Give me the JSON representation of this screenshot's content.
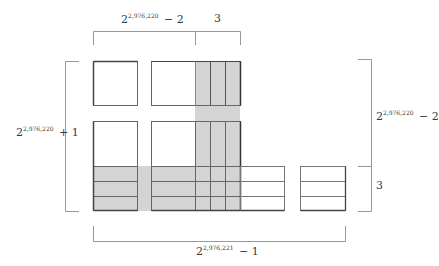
{
  "diagram": {
    "colors": {
      "shade": "#d3d3d3",
      "line": "#555555",
      "bracket": "#999999",
      "box_light": "#aaaaaa"
    },
    "labels": {
      "top_left": {
        "base": "2",
        "exp": "2,976,220",
        "tail": " − 2"
      },
      "top_right": {
        "text": "3"
      },
      "left": {
        "base": "2",
        "exp": "2,976,220",
        "tail": " + 1"
      },
      "right_upper": {
        "base": "2",
        "exp": "2,976,220",
        "tail": " − 2"
      },
      "right_lower": {
        "text": "3"
      },
      "bottom": {
        "base": "2",
        "exp": "2,976,221",
        "tail": " − 1"
      }
    }
  }
}
